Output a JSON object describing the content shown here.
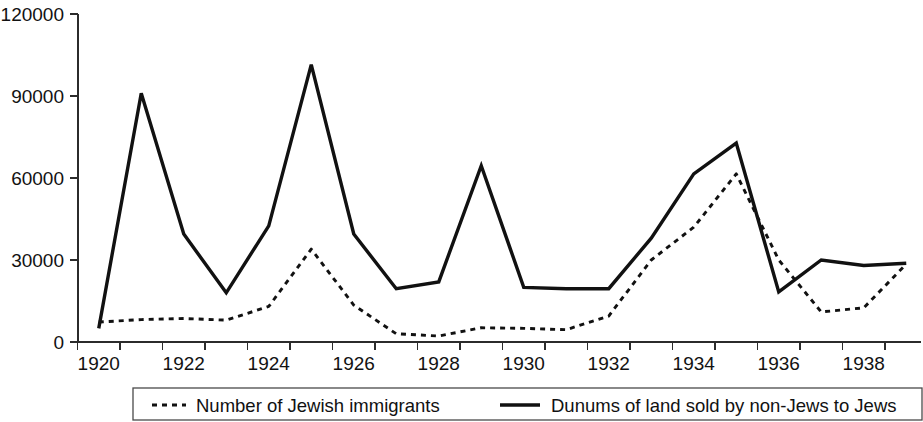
{
  "chart_data": {
    "type": "line",
    "title": "",
    "subtitle": "",
    "xlabel": "",
    "ylabel": "",
    "xlim": [
      1919.5,
      1939.5
    ],
    "ylim": [
      0,
      120000
    ],
    "grid": false,
    "legend_position": "bottom",
    "y_ticks": [
      0,
      30000,
      60000,
      90000,
      120000
    ],
    "y_tick_labels": [
      "0",
      "30000",
      "60000",
      "90000",
      "120000"
    ],
    "x_ticks": [
      1920,
      1922,
      1924,
      1926,
      1928,
      1930,
      1932,
      1934,
      1936,
      1938
    ],
    "x_tick_labels": [
      "1920",
      "1922",
      "1924",
      "1926",
      "1928",
      "1930",
      "1932",
      "1934",
      "1936",
      "1938"
    ],
    "x_minor_ticks": [
      1921,
      1923,
      1925,
      1927,
      1929,
      1931,
      1933,
      1935,
      1937,
      1939
    ],
    "x": [
      1920,
      1921,
      1922,
      1923,
      1924,
      1925,
      1926,
      1927,
      1928,
      1929,
      1930,
      1931,
      1932,
      1933,
      1934,
      1935,
      1936,
      1937,
      1938,
      1939
    ],
    "series": [
      {
        "name": "Number of Jewish immigrants",
        "style": "dashed",
        "color": "#111111",
        "values": [
          7300,
          8200,
          8600,
          8000,
          13000,
          34000,
          13500,
          3000,
          2200,
          5200,
          5000,
          4500,
          9500,
          30000,
          42000,
          61500,
          30000,
          11000,
          12500,
          28500
        ]
      },
      {
        "name": "Dunums of land sold by non-Jews to Jews",
        "style": "solid",
        "color": "#111111",
        "values": [
          5000,
          91000,
          39500,
          18000,
          42500,
          101500,
          39500,
          19500,
          22000,
          64500,
          20000,
          19500,
          19500,
          38000,
          61500,
          72800,
          18300,
          30000,
          28000,
          28800
        ]
      }
    ]
  },
  "legend": {
    "items": [
      {
        "label": "Number of Jewish immigrants",
        "style": "dashed"
      },
      {
        "label": "Dunums of land sold by non-Jews to Jews",
        "style": "solid"
      }
    ]
  }
}
